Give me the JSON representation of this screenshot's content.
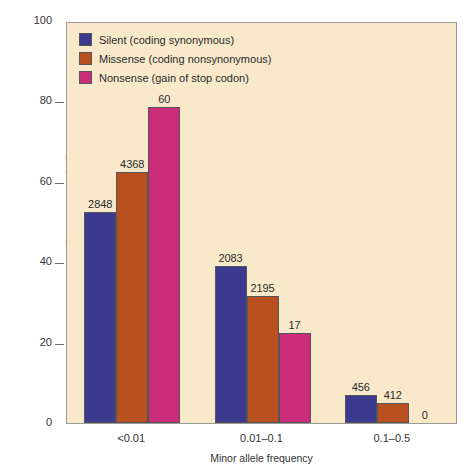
{
  "chart_data": {
    "type": "bar",
    "title": "",
    "xlabel": "Minor allele frequency",
    "ylabel": "Percentage of SNPs",
    "categories": [
      "<0.01",
      "0.01–0.1",
      "0.1–0.5"
    ],
    "ylim": [
      0,
      100
    ],
    "yticks": [
      0,
      20,
      40,
      60,
      80,
      100
    ],
    "ytick_labels": [
      "0",
      "20",
      "40",
      "60",
      "80",
      "100"
    ],
    "grid": false,
    "legend_position": "top-left",
    "series": [
      {
        "name": "Silent (coding synonymous)",
        "color": "#3b3a8f",
        "values": [
          52.6,
          39.0,
          7.0
        ],
        "labels": [
          "2848",
          "2083",
          "456"
        ]
      },
      {
        "name": "Missense (coding nonsynonymous)",
        "color": "#b8501f",
        "values": [
          62.4,
          31.5,
          5.0
        ],
        "labels": [
          "4368",
          "2195",
          "412"
        ]
      },
      {
        "name": "Nonsense (gain of stop codon)",
        "color": "#cc2d7a",
        "values": [
          78.6,
          22.4,
          0.0
        ],
        "labels": [
          "60",
          "17",
          "0"
        ]
      }
    ]
  },
  "legend": {
    "items": [
      {
        "label": "Silent (coding synonymous)",
        "color": "#3b3a8f"
      },
      {
        "label": "Missense (coding nonsynonymous)",
        "color": "#b8501f"
      },
      {
        "label": "Nonsense (gain of stop codon)",
        "color": "#cc2d7a"
      }
    ]
  },
  "axes": {
    "y_label": "Percentage of SNPs",
    "x_label": "Minor allele frequency",
    "plot_background": "#f8e9cb",
    "frame_color": "#9a9a96"
  }
}
